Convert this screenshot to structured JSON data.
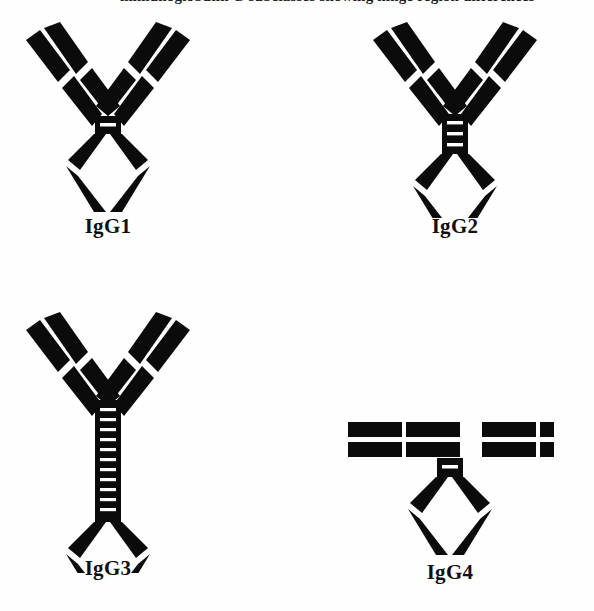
{
  "figure": {
    "caption_partial": "immunoglobulin G subclasses showing hinge region differences",
    "background_color": "#ffffff",
    "ink_color": "#0b0b0b",
    "width": 594,
    "height": 611
  },
  "panels": [
    {
      "id": "igg1",
      "label": "IgG1",
      "shape": "Y",
      "hinge_style": "short-block",
      "hinge_disulfides": 2,
      "hinge_lines": 1,
      "hinge_height": 18,
      "hinge_width": 26,
      "arm_angle_deg": 52,
      "x": 8,
      "y": 18,
      "label_x": 0,
      "label_y": 214
    },
    {
      "id": "igg2",
      "label": "IgG2",
      "shape": "Y",
      "hinge_style": "tall-block",
      "hinge_disulfides": 4,
      "hinge_lines": 3,
      "hinge_height": 40,
      "hinge_width": 26,
      "arm_angle_deg": 52,
      "x": 355,
      "y": 18,
      "label_x": 0,
      "label_y": 214
    },
    {
      "id": "igg3",
      "label": "IgG3",
      "shape": "Y",
      "hinge_style": "extended-ladder",
      "hinge_disulfides": 11,
      "hinge_lines": 11,
      "hinge_height": 120,
      "hinge_width": 26,
      "arm_angle_deg": 52,
      "x": 8,
      "y": 308,
      "label_x": 0,
      "label_y": 560
    },
    {
      "id": "igg4",
      "label": "IgG4",
      "shape": "T",
      "hinge_style": "short-block",
      "hinge_disulfides": 2,
      "hinge_lines": 1,
      "hinge_height": 18,
      "hinge_width": 26,
      "arm_angle_deg": 0,
      "x": 330,
      "y": 400,
      "label_x": 0,
      "label_y": 560
    }
  ],
  "legend_semantics": {
    "fab_arm": "antigen-binding fragment, two parallel chains",
    "light_chain": "outer shorter chain with VL and CL domains",
    "heavy_chain": "inner longer chain with VH and CH1 domains",
    "hinge": "black block with white interchain disulfide lines",
    "fc_region": "diamond shaped CH2 and CH3 heavy chain domains"
  }
}
